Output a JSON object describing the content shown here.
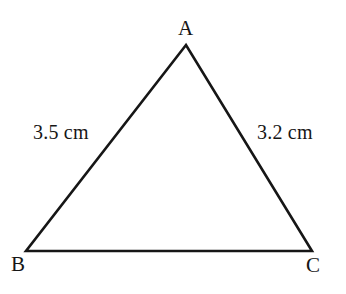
{
  "figure": {
    "type": "geometry-diagram",
    "shape": "triangle",
    "background_color": "#ffffff",
    "stroke_color": "#161616",
    "stroke_width": 2.6,
    "width": 346,
    "height": 294,
    "vertices": [
      {
        "name": "A",
        "label": "A",
        "x": 186,
        "y": 45,
        "label_x": 178,
        "label_y": 18
      },
      {
        "name": "B",
        "label": "B",
        "x": 26,
        "y": 251,
        "label_x": 11,
        "label_y": 254
      },
      {
        "name": "C",
        "label": "C",
        "x": 312,
        "y": 251,
        "label_x": 306,
        "label_y": 255
      }
    ],
    "sides": [
      {
        "name": "AB",
        "label": "3.5 cm",
        "value": 3.5,
        "unit": "cm",
        "label_x": 33,
        "label_y": 122
      },
      {
        "name": "AC",
        "label": "3.2 cm",
        "value": 3.2,
        "unit": "cm",
        "label_x": 257,
        "label_y": 122
      },
      {
        "name": "BC",
        "label": "",
        "value": null,
        "unit": "cm"
      }
    ]
  }
}
